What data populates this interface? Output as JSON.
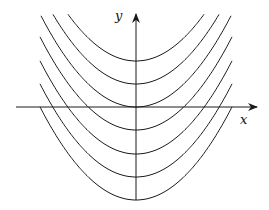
{
  "diagram": {
    "axes": {
      "x_label": "x",
      "y_label": "y",
      "origin_px": [
        136,
        107
      ],
      "x_axis_px": [
        16,
        257
      ],
      "y_axis_px": [
        200,
        14
      ]
    },
    "curve_family": {
      "equation": "y = x^2 + C",
      "vertex_offsets_px": [
        -46,
        -23,
        0,
        23,
        47,
        70,
        93
      ],
      "curvature_px": 0.0101,
      "clip_x_px": [
        40,
        232
      ],
      "clip_top_px": 14
    },
    "colors": {
      "stroke": "#1a1a1a",
      "background": "#ffffff"
    }
  }
}
